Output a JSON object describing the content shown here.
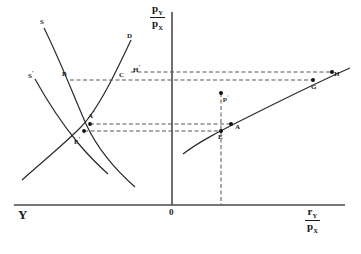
{
  "figure": {
    "background_color": "#ffffff",
    "line_color": "#2b2b2b",
    "dash_color": "#555555"
  },
  "axes": {
    "vertical": {
      "name": "price-ratio-axis",
      "numerator": "p",
      "numerator_sub": "Y",
      "denominator": "p",
      "denominator_sub": "X"
    },
    "horizontal_right": {
      "name": "real-resource-axis",
      "numerator": "r",
      "numerator_sub": "Y",
      "denominator": "p",
      "denominator_sub": "X"
    },
    "horizontal_left_label": "Y",
    "origin_label": "0"
  },
  "curves": [
    {
      "id": "S",
      "label": "S",
      "panel": "left",
      "shape": "downward-sloping"
    },
    {
      "id": "Sp",
      "label": "S",
      "prime": "'",
      "panel": "left",
      "shape": "downward-sloping-shifted"
    },
    {
      "id": "D",
      "label": "D",
      "panel": "left",
      "shape": "upward-sloping"
    },
    {
      "id": "R",
      "label": "",
      "panel": "right",
      "shape": "concave-increasing"
    }
  ],
  "points": [
    {
      "id": "B",
      "label": "B",
      "prime": "",
      "x": 62,
      "y": 78,
      "panel": "left",
      "marked": false
    },
    {
      "id": "C",
      "label": "C",
      "prime": "",
      "x": 120,
      "y": 79,
      "panel": "left",
      "marked": false
    },
    {
      "id": "Hp",
      "label": "H",
      "prime": "'",
      "x": 133,
      "y": 72,
      "panel": "left",
      "marked": false
    },
    {
      "id": "Ap",
      "label": "A",
      "prime": "'",
      "x": 89,
      "y": 117,
      "panel": "left",
      "marked": true
    },
    {
      "id": "Ep",
      "label": "E",
      "prime": "'",
      "x": 82,
      "y": 130,
      "panel": "left",
      "marked": true
    },
    {
      "id": "p0",
      "label": "p",
      "prime": "°",
      "x": 221,
      "y": 95,
      "panel": "right",
      "marked": true
    },
    {
      "id": "E",
      "label": "E",
      "prime": "",
      "x": 221,
      "y": 131,
      "panel": "right",
      "marked": true
    },
    {
      "id": "A",
      "label": "A",
      "prime": "",
      "x": 231,
      "y": 124,
      "panel": "right",
      "marked": true
    },
    {
      "id": "G",
      "label": "G",
      "prime": "",
      "x": 313,
      "y": 85,
      "panel": "right",
      "marked": true
    },
    {
      "id": "H",
      "label": "H",
      "prime": "",
      "x": 332,
      "y": 76,
      "panel": "right",
      "marked": true
    }
  ],
  "guidelines": [
    {
      "id": "g-upper-1",
      "kind": "horizontal-dashed",
      "y": 72,
      "note": "through H' and H"
    },
    {
      "id": "g-upper-2",
      "kind": "horizontal-dashed",
      "y": 80,
      "note": "through B, C and G"
    },
    {
      "id": "g-lower-1",
      "kind": "horizontal-dashed",
      "y": 124,
      "note": "through A' and A"
    },
    {
      "id": "g-lower-2",
      "kind": "horizontal-dashed",
      "y": 131,
      "note": "through E' and E"
    },
    {
      "id": "g-vertical",
      "kind": "vertical-dashed",
      "x": 221,
      "note": "through p°, E down to x-axis"
    }
  ]
}
